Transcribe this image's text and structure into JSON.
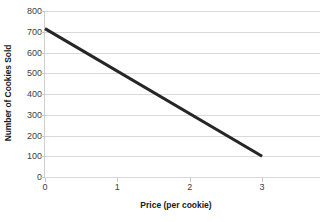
{
  "chart_data": {
    "type": "line",
    "title": "",
    "xlabel": "Price (per cookie)",
    "ylabel": "Number of Cookies Sold",
    "xlim": [
      0,
      3.8
    ],
    "ylim": [
      0,
      800
    ],
    "grid": true,
    "legend": false,
    "x_ticks": [
      "0",
      "1",
      "2",
      "3"
    ],
    "x_tick_values": [
      0,
      1,
      2,
      3
    ],
    "y_ticks": [
      "0",
      "100",
      "200",
      "300",
      "400",
      "500",
      "600",
      "700",
      "800"
    ],
    "y_tick_values": [
      0,
      100,
      200,
      300,
      400,
      500,
      600,
      700,
      800
    ],
    "series": [
      {
        "name": "Demand",
        "color": "#262626",
        "line_width": 3,
        "x": [
          0,
          3
        ],
        "values": [
          715,
          100
        ]
      }
    ]
  },
  "axes": {
    "y_title": "Number of Cookies Sold",
    "x_title": "Price (per cookie)"
  }
}
